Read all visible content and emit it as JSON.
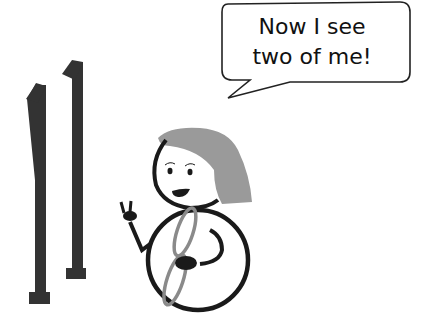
{
  "speech_bubble": {
    "line1": "Now I see",
    "line2": "two of me!"
  },
  "illustration": {
    "numerals": [
      "1",
      "1"
    ],
    "figure": "girl-with-figure-eight-body",
    "colors": {
      "ink": "#1a1a1a",
      "numeral": "#333333",
      "hair": "#9a9a9a",
      "eight": "#8a8a8a",
      "background": "#ffffff"
    }
  }
}
